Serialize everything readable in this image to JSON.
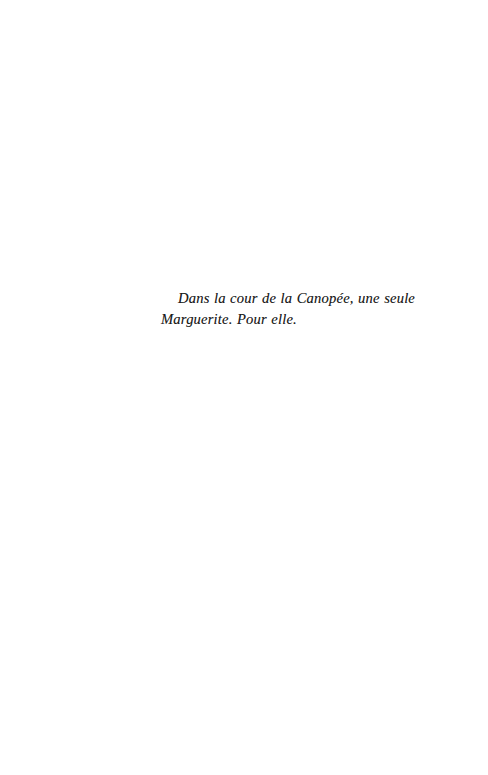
{
  "page": {
    "width": 488,
    "height": 775,
    "background_color": "#ffffff",
    "text_color": "#1b1b1b",
    "type": "book-page",
    "section": "epigraph"
  },
  "epigraph": {
    "text": "Dans la cour de la Canopée, une seule Marguerite. Pour elle.",
    "lines": [
      "Dans la cour de la Canopée, une seule",
      "Marguerite. Pour elle."
    ],
    "language": "fr",
    "style": "italic"
  }
}
